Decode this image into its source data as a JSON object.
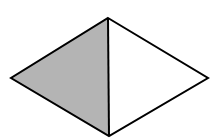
{
  "diagram": {
    "type": "rhombus-split",
    "vertices": {
      "top": [
        108,
        18
      ],
      "left": [
        11,
        78
      ],
      "right": [
        208,
        78
      ],
      "bottom": [
        109,
        136
      ]
    },
    "regions": [
      {
        "name": "left-triangle",
        "fill": "#b4b4b4",
        "points": [
          [
            108,
            18
          ],
          [
            11,
            78
          ],
          [
            109,
            136
          ]
        ]
      },
      {
        "name": "right-triangle",
        "fill": "#ffffff",
        "points": [
          [
            108,
            18
          ],
          [
            208,
            78
          ],
          [
            109,
            136
          ]
        ]
      }
    ],
    "stroke": {
      "color": "#000000",
      "width": 2
    },
    "divider": {
      "from": [
        108,
        18
      ],
      "to": [
        109,
        136
      ]
    }
  }
}
